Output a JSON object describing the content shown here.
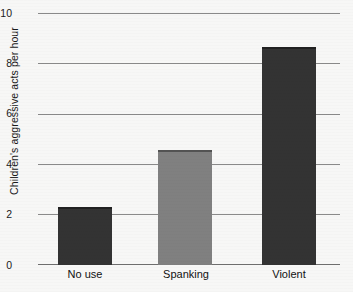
{
  "chart_data": {
    "type": "bar",
    "title": "",
    "xlabel": "",
    "ylabel": "Children's aggressive acts per hour",
    "categories": [
      "No use",
      "Spanking",
      "Violent"
    ],
    "values": [
      2.3,
      4.6,
      8.7
    ],
    "ylim": [
      0,
      10
    ],
    "yticks": [
      0,
      2,
      4,
      6,
      8,
      10
    ],
    "ytick_labels": [
      "0",
      "2",
      "4",
      "6",
      "8",
      "10"
    ],
    "grid": true,
    "legend": "none",
    "bar_colors": [
      "#333333",
      "#808080",
      "#333333"
    ]
  },
  "axis": {
    "y_title": "Children's aggressive acts per hour",
    "tick_0": "0",
    "tick_2": "2",
    "tick_4": "4",
    "tick_6": "6",
    "tick_8": "8",
    "tick_10": "10"
  },
  "bars": [
    {
      "label": "No use",
      "value": 2.3,
      "color": "#333333"
    },
    {
      "label": "Spanking",
      "value": 4.6,
      "color": "#808080"
    },
    {
      "label": "Violent",
      "value": 8.7,
      "color": "#333333"
    }
  ],
  "colors": {
    "background": "#f7f7f6",
    "gridline": "#8a8a8a",
    "text": "#1a1a1a",
    "bar_dark": "#333333",
    "bar_mid": "#808080"
  }
}
